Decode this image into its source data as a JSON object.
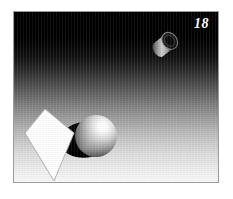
{
  "figure": {
    "plate_number": "18",
    "caption": "",
    "frame_color": "#9a9a9a",
    "page_background": "#ffffff"
  },
  "scene": {
    "name": "raytraced-still-life",
    "background": {
      "type": "vertical-gradient",
      "top_color": "#000000",
      "bottom_color": "#fbfbfb",
      "description": "black at top fading to white at bottom"
    },
    "objects": [
      {
        "id": "cylinder",
        "name": "tilted-cylinder",
        "shape": "cylinder",
        "position": {
          "x": 150,
          "y": 28
        },
        "body_color": "#b9b9b9",
        "cap_color": "#1a1a1a",
        "rim_color": "#6e6e6e"
      },
      {
        "id": "diamond",
        "name": "white-kite-polygon",
        "shape": "quadrilateral",
        "fill_color": "#ffffff",
        "stroke_color": "#b0b0b0",
        "vertices": [
          {
            "x": 31,
            "y": 97
          },
          {
            "x": 60,
            "y": 121
          },
          {
            "x": 40,
            "y": 169
          },
          {
            "x": 11,
            "y": 121
          }
        ]
      },
      {
        "id": "shadow",
        "name": "cast-shadow",
        "shape": "ellipse-sweep",
        "fill_color": "#000000"
      },
      {
        "id": "sphere",
        "name": "shaded-sphere",
        "shape": "sphere",
        "center": {
          "x": 82,
          "y": 124
        },
        "radius": 21,
        "highlight": {
          "x": 90,
          "y": 114,
          "color": "#ffffff"
        },
        "base_color": "#a8a8a8",
        "terminator_color": "#1c1c1c"
      }
    ]
  }
}
